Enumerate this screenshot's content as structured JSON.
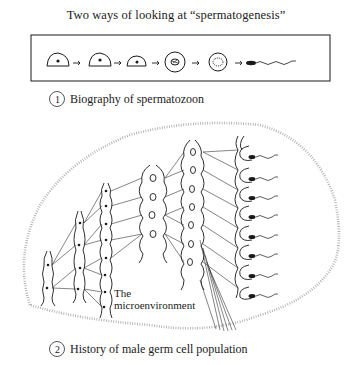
{
  "title": "Two ways of looking at “spermatogenesis”",
  "panel1": {
    "badge": "1",
    "caption": "Biography of spermatozoon",
    "stages": [
      "spermatogonium",
      "spermatogonium",
      "spermatogonium",
      "spermatocyte",
      "spermatid",
      "spermatozoon"
    ]
  },
  "panel2": {
    "badge": "2",
    "caption": "History of male germ cell population",
    "label_line1": "The",
    "label_line2": "microenvironment",
    "columns": [
      {
        "stage": "column-1",
        "cells": 2
      },
      {
        "stage": "column-2",
        "cells": 4
      },
      {
        "stage": "column-3",
        "cells": 8
      },
      {
        "stage": "column-4",
        "cells": 4
      },
      {
        "stage": "column-5",
        "cells": 7
      },
      {
        "stage": "column-6",
        "cells": 8
      }
    ]
  },
  "colors": {
    "ink": "#1a1a1a",
    "stipple": "#9a9a9a"
  }
}
